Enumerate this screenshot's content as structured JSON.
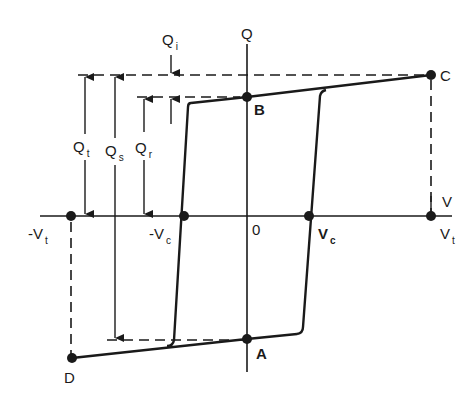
{
  "diagram": {
    "type": "hysteresis-loop",
    "axes": {
      "vertical_label": "Q",
      "horizontal_label": "V",
      "origin_label": "0"
    },
    "points": {
      "A": {
        "label": "A"
      },
      "B": {
        "label": "B"
      },
      "C": {
        "label": "C"
      },
      "D": {
        "label": "D"
      }
    },
    "voltage_ticks": {
      "neg_vt": {
        "main": "-V",
        "sub": "t"
      },
      "neg_vc": {
        "main": "-V",
        "sub": "c"
      },
      "vc": {
        "main": "V",
        "sub": "c"
      },
      "vt": {
        "main": "V",
        "sub": "t"
      }
    },
    "charge_dimensions": {
      "qi": {
        "main": "Q",
        "sub": "i"
      },
      "qt": {
        "main": "Q",
        "sub": "t"
      },
      "qs": {
        "main": "Q",
        "sub": "s"
      },
      "qr": {
        "main": "Q",
        "sub": "r"
      }
    },
    "colors": {
      "line": "#1a1a1a",
      "background": "#ffffff"
    }
  }
}
